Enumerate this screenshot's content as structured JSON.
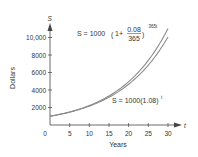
{
  "chart_data": {
    "type": "line",
    "title": "",
    "xlabel": "Years",
    "ylabel": "Dollars",
    "x_axis_var": "t",
    "y_axis_var": "S",
    "xlim": [
      0,
      30
    ],
    "ylim": [
      0,
      11000
    ],
    "x_ticks": [
      0,
      5,
      10,
      15,
      20,
      25,
      30
    ],
    "x_tick_labels": [
      "0",
      "5",
      "10",
      "15",
      "20",
      "25",
      "30"
    ],
    "y_ticks": [
      2000,
      4000,
      6000,
      8000,
      10000
    ],
    "y_tick_labels": [
      "2000",
      "4000",
      "6000",
      "8000",
      "10,000"
    ],
    "grid": false,
    "legend": "none",
    "x": [
      0,
      5,
      10,
      15,
      20,
      25,
      30
    ],
    "series": [
      {
        "name": "S = 1000(1 + 0.08/365)^(365t)",
        "values": [
          1000,
          1492,
          2226,
          3320,
          4953,
          7389,
          11023
        ]
      },
      {
        "name": "S = 1000(1.08)^t",
        "values": [
          1000,
          1469,
          2159,
          3172,
          4661,
          6848,
          10063
        ]
      }
    ],
    "annotations": [
      {
        "text": "S = 1000(1 + 0.08/365)^365t",
        "position": "upper-middle"
      },
      {
        "text": "S = 1000(1.08)^t",
        "position": "lower-right"
      }
    ]
  },
  "labels": {
    "y_var": "S",
    "x_var": "t",
    "xlabel": "Years",
    "ylabel": "Dollars",
    "origin": "0",
    "x_ticks": [
      "5",
      "10",
      "15",
      "20",
      "25",
      "30"
    ],
    "y_ticks": [
      "2000",
      "4000",
      "6000",
      "8000",
      "10,000"
    ],
    "eq1": {
      "lhs": "S = 1000",
      "one_plus": "1+",
      "num": "0.08",
      "den": "365",
      "exp": "365t"
    },
    "eq2": {
      "lhs": "S = 1000(1.08)",
      "exp": "t"
    }
  },
  "colors": {
    "axis": "#444444",
    "curve": "#8a8a8a",
    "text": "#333333"
  }
}
